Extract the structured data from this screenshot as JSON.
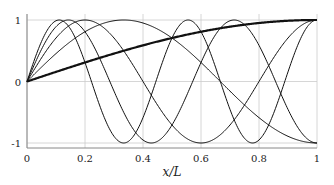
{
  "chart_data": {
    "type": "line",
    "title": "",
    "xlabel": "x/L",
    "ylabel": "",
    "xlim": [
      0,
      1
    ],
    "ylim": [
      -1.05,
      1.05
    ],
    "grid": true,
    "legend": null,
    "x_ticks": [
      "0",
      "0.2",
      "0.4",
      "0.6",
      "0.8",
      "1"
    ],
    "y_ticks": [
      "-1",
      "0",
      "1"
    ],
    "series": [
      {
        "name": "mode 1",
        "function": "sin(pi*x/2)",
        "k": 1,
        "thick": true
      },
      {
        "name": "mode 2",
        "function": "sin(3*pi*x/2)",
        "k": 3,
        "thick": false
      },
      {
        "name": "mode 3",
        "function": "sin(5*pi*x/2)",
        "k": 5,
        "thick": false
      },
      {
        "name": "mode 4",
        "function": "sin(7*pi*x/2)",
        "k": 7,
        "thick": false
      },
      {
        "name": "mode 5",
        "function": "sin(9*pi*x/2)",
        "k": 9,
        "thick": false
      }
    ],
    "colors": {
      "line": "#111111",
      "grid": "#cccccc",
      "axis": "#888888"
    }
  }
}
